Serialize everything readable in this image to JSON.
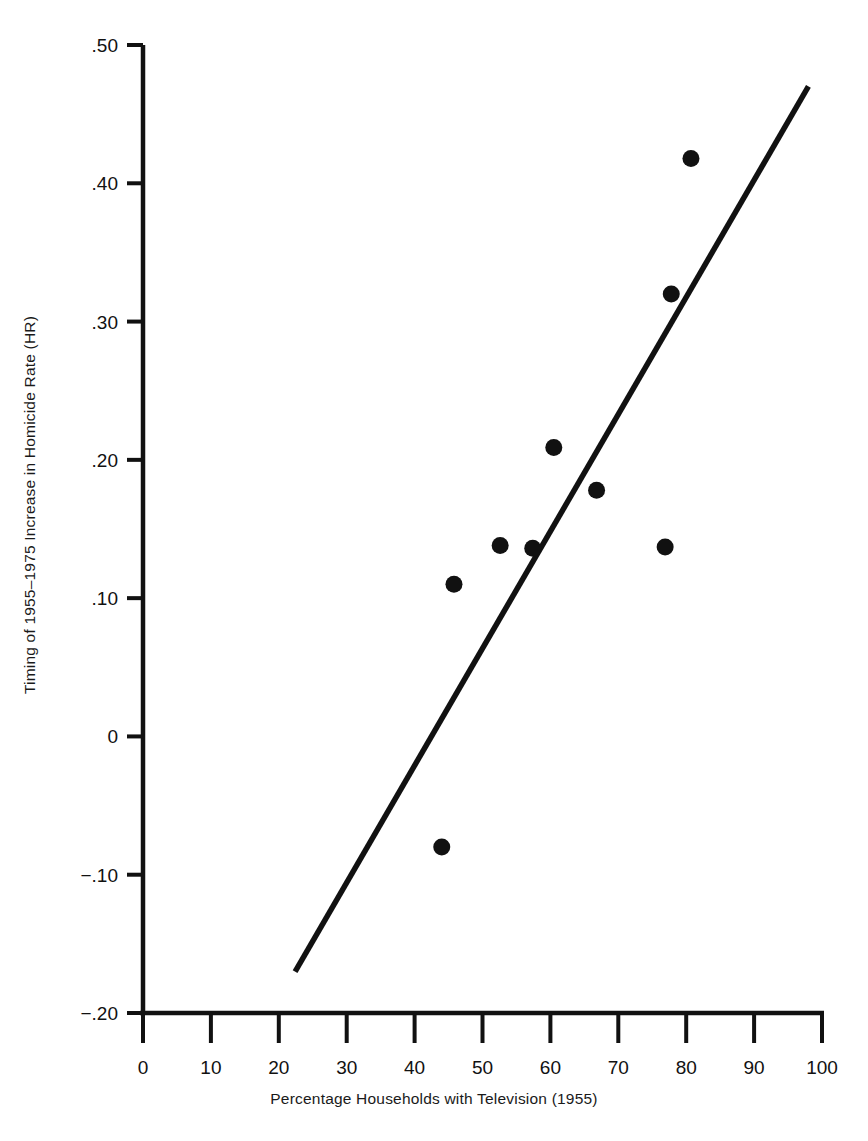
{
  "chart_data": {
    "type": "scatter",
    "title": "",
    "xlabel": "Percentage Households with Television (1955)",
    "ylabel": "Timing of 1955–1975 Increase in Homicide Rate (HR)",
    "xlim": [
      0,
      100
    ],
    "ylim": [
      -0.2,
      0.5
    ],
    "grid": false,
    "legend": "none",
    "x_ticks": [
      "0",
      "10",
      "20",
      "30",
      "40",
      "50",
      "60",
      "70",
      "80",
      "90",
      "100"
    ],
    "x_tick_values": [
      0,
      10,
      20,
      30,
      40,
      50,
      60,
      70,
      80,
      90,
      100
    ],
    "y_ticks": [
      ".50",
      ".40",
      ".30",
      ".20",
      ".10",
      "0",
      "−.10",
      "−.20"
    ],
    "y_tick_values": [
      0.5,
      0.4,
      0.3,
      0.2,
      0.1,
      0,
      -0.1,
      -0.2
    ],
    "series": [
      {
        "name": "states",
        "marker": "filled-circle",
        "color": "#111111",
        "points": [
          {
            "x": 44.0,
            "y": -0.08
          },
          {
            "x": 45.8,
            "y": 0.11
          },
          {
            "x": 52.6,
            "y": 0.138
          },
          {
            "x": 57.4,
            "y": 0.136
          },
          {
            "x": 60.5,
            "y": 0.209
          },
          {
            "x": 66.8,
            "y": 0.178
          },
          {
            "x": 76.9,
            "y": 0.137
          },
          {
            "x": 77.8,
            "y": 0.32
          },
          {
            "x": 80.7,
            "y": 0.418
          }
        ]
      },
      {
        "name": "regression-line",
        "marker": "line",
        "color": "#111111",
        "points": [
          {
            "x": 22.4,
            "y": -0.17
          },
          {
            "x": 98.0,
            "y": 0.47
          }
        ]
      }
    ]
  },
  "axes": {
    "x_axis_name": "x-axis",
    "y_axis_name": "y-axis",
    "axis_color": "#111111"
  }
}
